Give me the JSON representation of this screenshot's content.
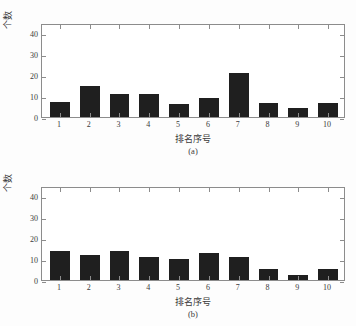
{
  "figure": {
    "background": "#fdfdfd",
    "bar_color": "#1f1f1f",
    "axis_color": "#8c8c8c"
  },
  "chart_data": [
    {
      "type": "bar",
      "title": "",
      "caption": "(a)",
      "xlabel": "排名序号",
      "ylabel": "个数",
      "categories": [
        "1",
        "2",
        "3",
        "4",
        "5",
        "6",
        "7",
        "8",
        "9",
        "10"
      ],
      "values": [
        7,
        15,
        11,
        11,
        6,
        9,
        21,
        6.5,
        4.5,
        6.5
      ],
      "yticks": [
        0,
        10,
        20,
        30,
        40
      ],
      "ylim": [
        0,
        45
      ],
      "xlim": [
        0.4,
        10.6
      ],
      "grid": false,
      "legend": null
    },
    {
      "type": "bar",
      "title": "",
      "caption": "(b)",
      "xlabel": "排名序号",
      "ylabel": "个数",
      "categories": [
        "1",
        "2",
        "3",
        "4",
        "5",
        "6",
        "7",
        "8",
        "9",
        "10"
      ],
      "values": [
        14,
        12,
        14,
        11,
        10,
        13,
        11,
        5.5,
        2.5,
        5.5
      ],
      "yticks": [
        0,
        10,
        20,
        30,
        40
      ],
      "ylim": [
        0,
        45
      ],
      "xlim": [
        0.4,
        10.6
      ],
      "grid": false,
      "legend": null
    }
  ]
}
